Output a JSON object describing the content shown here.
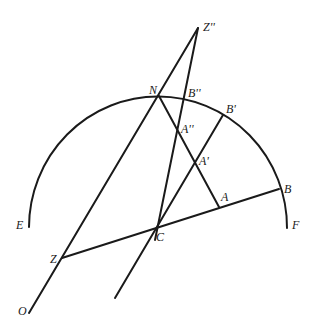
{
  "diagram": {
    "type": "geometric-construction",
    "circle": {
      "cx": 158,
      "cy": 227,
      "r": 129,
      "arc_from": "E",
      "arc_to": "F"
    },
    "points": [
      {
        "id": "Zpp",
        "label": "Z''",
        "x": 198,
        "y": 28,
        "lx": 204,
        "ly": 30
      },
      {
        "id": "N",
        "label": "N",
        "x": 159,
        "y": 96,
        "lx": 149,
        "ly": 93
      },
      {
        "id": "Bpp",
        "label": "B''",
        "x": 185,
        "y": 97,
        "lx": 189,
        "ly": 96
      },
      {
        "id": "Bp",
        "label": "B'",
        "x": 223,
        "y": 115,
        "lx": 226,
        "ly": 112
      },
      {
        "id": "App",
        "label": "A''",
        "x": 178,
        "y": 128,
        "lx": 181,
        "ly": 132
      },
      {
        "id": "Ap",
        "label": "A'",
        "x": 196,
        "y": 163,
        "lx": 199,
        "ly": 164
      },
      {
        "id": "A",
        "label": "A",
        "x": 219,
        "y": 207,
        "lx": 221,
        "ly": 201
      },
      {
        "id": "B",
        "label": "B",
        "x": 279,
        "y": 189,
        "lx": 284,
        "ly": 192
      },
      {
        "id": "C",
        "label": "C",
        "x": 158,
        "y": 227,
        "lx": 156,
        "ly": 240
      },
      {
        "id": "Z",
        "label": "Z",
        "x": 62,
        "y": 258,
        "lx": 50,
        "ly": 262
      },
      {
        "id": "E",
        "label": "E",
        "x": 29,
        "y": 227,
        "lx": 17,
        "ly": 228
      },
      {
        "id": "F",
        "label": "F",
        "x": 287,
        "y": 228,
        "lx": 293,
        "ly": 228
      },
      {
        "id": "O",
        "label": "O",
        "x": 29,
        "y": 313,
        "lx": 18,
        "ly": 314
      }
    ],
    "segments": [
      [
        "O",
        "Zpp"
      ],
      [
        "Zpp",
        "Cdown"
      ],
      [
        "N",
        "A"
      ],
      [
        "Z",
        "B"
      ],
      [
        "Bp",
        "Cend"
      ]
    ]
  }
}
